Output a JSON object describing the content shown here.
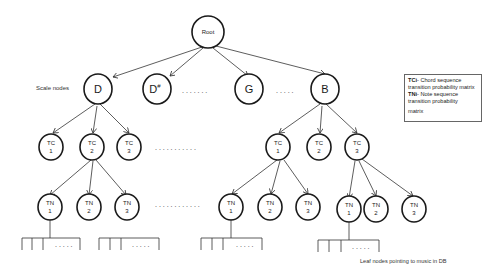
{
  "root": {
    "label": "Root"
  },
  "scale_label": "Scale nodes",
  "scale_nodes": [
    {
      "label": "D"
    },
    {
      "label": "D#"
    },
    {
      "label": "G"
    },
    {
      "label": "B"
    }
  ],
  "scale_ellipsis_1": ". . . .   . . .",
  "scale_ellipsis_2": ". . . . .",
  "tc_prefix": "TC",
  "tn_prefix": "TN",
  "tc_left": [
    {
      "num": "1"
    },
    {
      "num": "2"
    },
    {
      "num": "3"
    }
  ],
  "tc_right": [
    {
      "num": "1"
    },
    {
      "num": "2"
    },
    {
      "num": "3"
    }
  ],
  "tn_left": [
    {
      "num": "1"
    },
    {
      "num": "2"
    },
    {
      "num": "3"
    }
  ],
  "tn_mid": [
    {
      "num": "1"
    },
    {
      "num": "2"
    },
    {
      "num": "3"
    }
  ],
  "tn_right": [
    {
      "num": "1"
    },
    {
      "num": "2"
    },
    {
      "num": "3"
    }
  ],
  "tc_ellipsis": ". . . .  . . . . . . .",
  "tn_ellipsis": ". . . .  . . . . . . . .",
  "leaf_ellipsis": ". . . . .",
  "legend": {
    "tc_key": "TCi",
    "tc_text": "- Chord sequence transition probability matrix",
    "tn_key": "TNi",
    "tn_text": "- Note sequence transition probability",
    "tn_text_2": "matrix"
  },
  "leaf_caption": "Leaf nodes pointing to music in DB"
}
